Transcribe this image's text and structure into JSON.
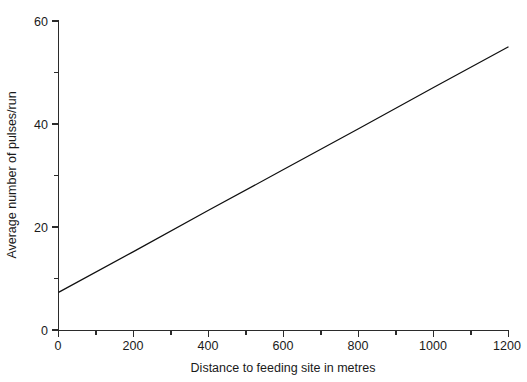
{
  "chart_data": {
    "type": "line",
    "title": "",
    "xlabel": "Distance to feeding site in metres",
    "ylabel": "Average number of pulses/run",
    "xlim": [
      0,
      1200
    ],
    "ylim": [
      0,
      60
    ],
    "grid": false,
    "legend": null,
    "x_major_ticks": [
      0,
      200,
      400,
      600,
      800,
      1000,
      1200
    ],
    "x_major_tick_labels": [
      "0",
      "200",
      "400",
      "600",
      "800",
      "1000",
      "1200"
    ],
    "x_minor_ticks": [
      100,
      300,
      500,
      700,
      900,
      1100
    ],
    "y_major_ticks": [
      0,
      20,
      40,
      60
    ],
    "y_major_tick_labels": [
      "0",
      "20",
      "40",
      "60"
    ],
    "y_minor_ticks": [
      10,
      30,
      50
    ],
    "series": [
      {
        "name": "Average pulses per run vs distance",
        "style": "solid-line",
        "color": "#101010",
        "x": [
          0,
          1200
        ],
        "values": [
          7.4,
          55.0
        ],
        "points": [
          {
            "x": 0,
            "y": 7.4
          },
          {
            "x": 200,
            "y": 15.3
          },
          {
            "x": 400,
            "y": 23.3
          },
          {
            "x": 600,
            "y": 31.2
          },
          {
            "x": 800,
            "y": 39.1
          },
          {
            "x": 1000,
            "y": 47.1
          },
          {
            "x": 1200,
            "y": 55.0
          }
        ]
      }
    ]
  },
  "figure": {
    "background_color": "#ffffff",
    "axis_color": "#2b2b2b",
    "line_color": "#101010"
  }
}
